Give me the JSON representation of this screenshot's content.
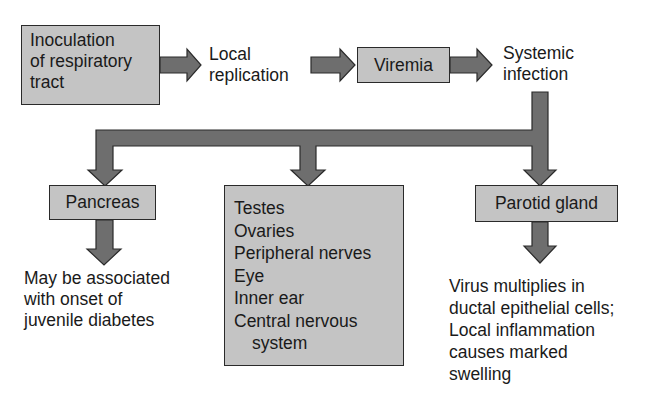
{
  "diagram": {
    "colors": {
      "box_fill": "#c4c4c4",
      "arrow_fill": "#6e6e6e",
      "outline": "#2a2a2a",
      "text": "#1a1a1a"
    },
    "flow": {
      "inoculation": [
        "Inoculation",
        "of respiratory",
        "tract"
      ],
      "local_replication": [
        "Local",
        "replication"
      ],
      "viremia": "Viremia",
      "systemic_infection": [
        "Systemic",
        "infection"
      ]
    },
    "branches": {
      "pancreas": {
        "label": "Pancreas",
        "outcome": [
          "May be associated",
          "with onset of",
          "juvenile diabetes"
        ]
      },
      "other_sites": {
        "items": [
          "Testes",
          "Ovaries",
          "Peripheral nerves",
          "Eye",
          "Inner ear",
          "Central nervous",
          "system"
        ]
      },
      "parotid": {
        "label": "Parotid gland",
        "outcome": [
          "Virus multiplies in",
          "ductal epithelial cells;",
          "Local inflammation",
          "causes marked",
          "swelling"
        ]
      }
    }
  }
}
